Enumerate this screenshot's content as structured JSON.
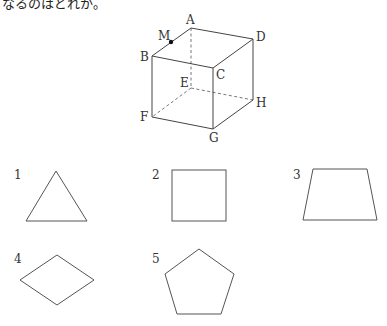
{
  "question": {
    "text_fragment": "なるのはどれか。"
  },
  "cube": {
    "vertices": {
      "A": "A",
      "B": "B",
      "C": "C",
      "D": "D",
      "E": "E",
      "F": "F",
      "G": "G",
      "H": "H"
    },
    "point_m": "M"
  },
  "choices": [
    {
      "number": "1",
      "shape": "triangle"
    },
    {
      "number": "2",
      "shape": "square"
    },
    {
      "number": "3",
      "shape": "trapezoid"
    },
    {
      "number": "4",
      "shape": "rhombus"
    },
    {
      "number": "5",
      "shape": "pentagon"
    }
  ]
}
